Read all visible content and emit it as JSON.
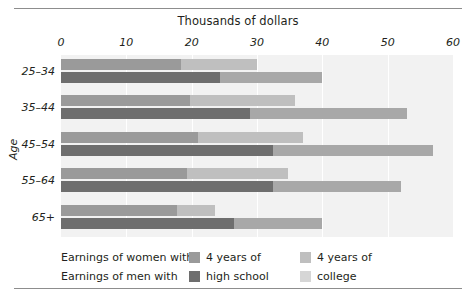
{
  "chart_data": {
    "type": "bar",
    "orientation": "horizontal",
    "title": "",
    "xlabel": "Thousands of dollars",
    "ylabel": "Age",
    "xlim": [
      0,
      60
    ],
    "xticks": [
      0,
      10,
      20,
      30,
      40,
      50,
      60
    ],
    "xticklabels": [
      "0",
      "10",
      "20",
      "30",
      "40",
      "50",
      "60"
    ],
    "grid": true,
    "categories": [
      "25–34",
      "35–44",
      "45–54",
      "55–64",
      "65+"
    ],
    "legend_position": "bottom",
    "series": [
      {
        "name": "Earnings of women with 4 years of high school",
        "group": "women",
        "level": "high school",
        "color": "#9a9a9a",
        "values": [
          18.4,
          19.8,
          21.0,
          19.3,
          17.8
        ]
      },
      {
        "name": "Earnings of women with 4 years of college",
        "group": "women",
        "level": "college",
        "color": "#bfbfbf",
        "values": [
          11.6,
          16.0,
          16.0,
          15.5,
          5.8
        ],
        "cumulative_ends": [
          30.0,
          35.8,
          37.0,
          34.8,
          23.6
        ]
      },
      {
        "name": "Earnings of men with 4 years of high school",
        "group": "men",
        "level": "high school",
        "color": "#6e6e6e",
        "values": [
          24.3,
          29.0,
          32.5,
          32.5,
          26.5
        ]
      },
      {
        "name": "Earnings of men with 4 years of college",
        "group": "men",
        "level": "college",
        "color": "#a8a8a8",
        "values": [
          15.7,
          24.0,
          24.5,
          19.5,
          13.5
        ],
        "cumulative_ends": [
          40.0,
          53.0,
          57.0,
          52.0,
          40.0
        ]
      }
    ]
  },
  "axis": {
    "x_title": "Thousands of dollars",
    "y_title": "Age",
    "ticks": [
      "0",
      "10",
      "20",
      "30",
      "40",
      "50",
      "60"
    ],
    "groups": [
      "25–34",
      "35–44",
      "45–54",
      "55–64",
      "65+"
    ]
  },
  "legend": {
    "row1_text": "Earnings of women with",
    "row2_text": "Earnings of men with",
    "hs_label_line1": "4 years of",
    "hs_label_line2": "high school",
    "col_label_line1": "4 years of",
    "col_label_line2": "college",
    "swatch_women_hs_color": "#9a9a9a",
    "swatch_men_hs_color": "#6e6e6e",
    "swatch_women_col_color": "#bfbfbf",
    "swatch_men_col_color": "#d6d6d6"
  },
  "colors": {
    "plot_background": "#f2f2f2",
    "gridline": "#ffffff",
    "rule": "#8d8d8d",
    "text": "#231f20"
  }
}
